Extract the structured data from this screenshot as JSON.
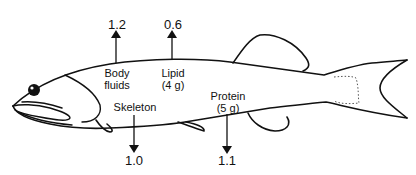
{
  "diagram": {
    "flows": [
      {
        "id": "body-fluids",
        "label_line1": "Body",
        "label_line2": "fluids",
        "value": "1.2",
        "direction": "up"
      },
      {
        "id": "lipid",
        "label_line1": "Lipid",
        "label_line2": "(4 g)",
        "value": "0.6",
        "direction": "up"
      },
      {
        "id": "skeleton",
        "label_line1": "Skeleton",
        "label_line2": "",
        "value": "1.0",
        "direction": "down"
      },
      {
        "id": "protein",
        "label_line1": "Protein",
        "label_line2": "(5 g)",
        "value": "1.1",
        "direction": "down"
      }
    ],
    "colors": {
      "line": "#111111",
      "background": "#ffffff"
    }
  }
}
